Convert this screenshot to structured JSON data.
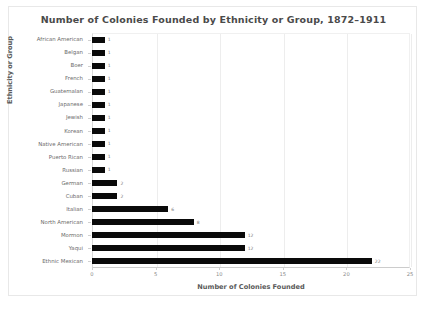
{
  "figure": {
    "title": "Number of Colonies Founded by Ethnicity or Group, 1872–1911",
    "background": "#ffffff",
    "bar_color": "#0a0a0a",
    "grid_color": "#ededed",
    "text_color": "#6b6b6b"
  },
  "chart_data": {
    "type": "bar",
    "orientation": "horizontal",
    "title": "Number of Colonies Founded by Ethnicity or Group, 1872–1911",
    "xlabel": "Number of Colonies Founded",
    "ylabel": "Ethnicity or Group",
    "categories": [
      "African American",
      "Belgan",
      "Boer",
      "French",
      "Guatemalan",
      "Japanese",
      "Jewish",
      "Korean",
      "Native American",
      "Puerto Rican",
      "Russian",
      "German",
      "Cuban",
      "Italian",
      "North American",
      "Mormon",
      "Yaqui",
      "Ethnic Mexican"
    ],
    "values": [
      1,
      1,
      1,
      1,
      1,
      1,
      1,
      1,
      1,
      1,
      1,
      2,
      2,
      6,
      8,
      12,
      12,
      22
    ],
    "value_labels": [
      "1",
      "1",
      "1",
      "1",
      "1",
      "1",
      "1",
      "1",
      "1",
      "1",
      "1",
      "2",
      "2",
      "6",
      "8",
      "12",
      "12",
      "22"
    ],
    "xlim": [
      0,
      25
    ],
    "xticks": [
      0,
      5,
      10,
      15,
      20,
      25
    ],
    "xticklabels": [
      "0",
      "5",
      "10",
      "15",
      "20",
      "25"
    ],
    "grid": true,
    "grid_axis": "x",
    "legend": false
  }
}
